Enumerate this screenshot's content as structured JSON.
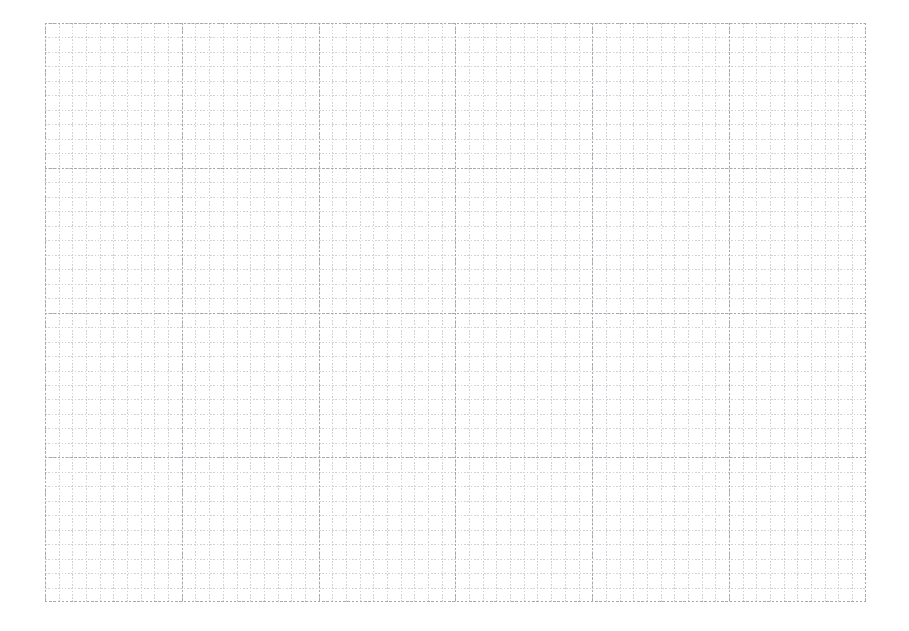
{
  "canvas": {
    "name": "grid-paper-sheet",
    "width": 909,
    "height": 631,
    "background_color": "#ffffff"
  },
  "sheet": {
    "left": 45,
    "top": 23,
    "width": 821,
    "height": 579,
    "paper_color": "#ffffff"
  },
  "grid": {
    "minor": {
      "color": "#d2d2d6",
      "spacing_x_px": 13.68,
      "spacing_y_px": 14.48,
      "line_width_px": 1,
      "style": "dotted"
    },
    "major": {
      "color": "#a6a9af",
      "spacing_x_px": 136.8,
      "spacing_y_px": 144.8,
      "line_width_px": 1,
      "style": "dashed"
    },
    "minor_cells_per_major": 10,
    "major_columns": 6,
    "major_rows": 4,
    "major_x_positions": [
      45,
      181,
      318,
      455,
      593,
      729,
      866
    ],
    "major_y_positions": [
      23,
      168,
      313,
      457,
      602
    ],
    "outer_border": false,
    "axis_labels": [],
    "tick_labels": [],
    "annotations": []
  },
  "content": {
    "title": "",
    "has_data_marks": false,
    "has_text": false,
    "description_label": ""
  }
}
